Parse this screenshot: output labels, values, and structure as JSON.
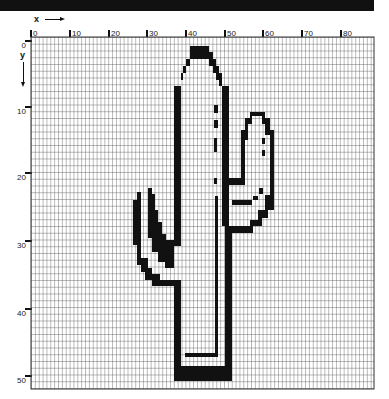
{
  "figure": {
    "type": "pixel-grid drawing",
    "x_axis_label": "x",
    "y_axis_label": "y",
    "x_tick_labels": [
      "0",
      "10",
      "20",
      "30",
      "40",
      "50",
      "60",
      "70",
      "80"
    ],
    "y_tick_labels": [
      "0",
      "10",
      "20",
      "30",
      "40",
      "50"
    ],
    "grid": {
      "columns": 89,
      "rows": 52,
      "origin": "top-left"
    },
    "colors": {
      "fill": "#111111",
      "grid": "#555555",
      "background": "#ffffff"
    }
  }
}
